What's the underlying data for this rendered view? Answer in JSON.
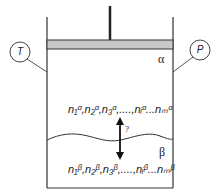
{
  "diagram": {
    "gauges": {
      "temperature": "T",
      "pressure": "P"
    },
    "phases": {
      "upper": "α",
      "lower": "β"
    },
    "upper_composition": "n₁ᵅ,n₂ᵅ,n₃ᵅ,....,nᵢᵅ...nₘᵅ",
    "lower_composition": "n₁ᵝ,n₂ᵝ,n₃ᵝ,....,nᵢᵝ...nₘᵝ",
    "transfer_label": "?",
    "colors": {
      "piston": "#c8c8c8",
      "line": "#222222",
      "background": "#ffffff"
    }
  }
}
